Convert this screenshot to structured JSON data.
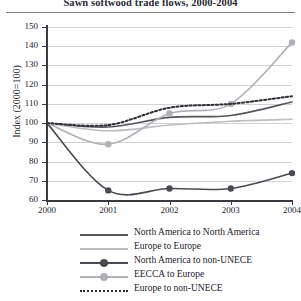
{
  "title": "Sawn softwood trade flows, 2000-2004",
  "chart_data": {
    "type": "line",
    "title": "Sawn softwood trade flows, 2000-2004",
    "xlabel": "",
    "ylabel": "Index (2000=100)",
    "x": [
      2000,
      2001,
      2002,
      2003,
      2004
    ],
    "xtick_labels": [
      "2000",
      "2001",
      "2002",
      "2003",
      "2004"
    ],
    "ytick_labels": [
      "60",
      "70",
      "80",
      "90",
      "100",
      "110",
      "120",
      "130",
      "140",
      "150"
    ],
    "yticks": [
      60,
      70,
      80,
      90,
      100,
      110,
      120,
      130,
      140,
      150
    ],
    "ylim": [
      60,
      150
    ],
    "xlim": [
      2000,
      2004
    ],
    "grid": true,
    "legend_position": "below",
    "series": [
      {
        "name": "North America to North America",
        "values": [
          100,
          98,
          103,
          104,
          111
        ],
        "style": "solid",
        "color": "#55555d",
        "marker": "none"
      },
      {
        "name": "Europe to Europe",
        "values": [
          100,
          96,
          99,
          101,
          102
        ],
        "style": "solid",
        "color": "#bdbdc2",
        "marker": "none"
      },
      {
        "name": "North America to non-UNECE",
        "values": [
          100,
          65,
          66,
          66,
          74
        ],
        "style": "solid",
        "color": "#4a4a52",
        "marker": "circle"
      },
      {
        "name": "EECCA to Europe",
        "values": [
          100,
          89,
          105,
          110,
          142
        ],
        "style": "solid",
        "color": "#b0b0b6",
        "marker": "circle"
      },
      {
        "name": "Europe to non-UNECE",
        "values": [
          100,
          99,
          108,
          110,
          114
        ],
        "style": "dotted",
        "color": "#2f2f36",
        "marker": "none"
      }
    ]
  }
}
